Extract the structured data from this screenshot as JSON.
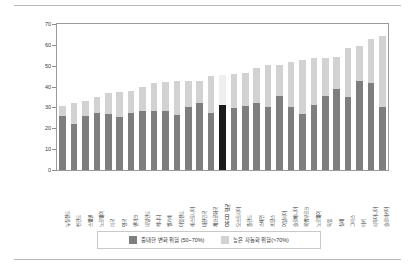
{
  "chart": {
    "type": "bar",
    "title": "",
    "axis": {
      "ylabel": "",
      "xlabel": "",
      "ylim": [
        0,
        70
      ],
      "yticks": [
        0,
        10,
        20,
        30,
        40,
        50,
        60,
        70
      ],
      "grid": false
    },
    "legend": {
      "position": "bottom",
      "entries": [
        {
          "label": "중대한 변화 위험 (50~70%)",
          "color": "#7e7e7e",
          "key": "significant_change"
        },
        {
          "label": "높은 자동화 위험(>70%)",
          "color": "#d2d2d2",
          "key": "high_automation"
        }
      ]
    },
    "highlight": {
      "category": "OECD 평균",
      "color": "#1a1a1a"
    }
  },
  "chart_data": {
    "type": "bar",
    "stacked": true,
    "title": "",
    "xlabel": "",
    "ylabel": "",
    "ylim": [
      0,
      70
    ],
    "yticks": [
      0,
      10,
      20,
      30,
      40,
      50,
      60,
      70
    ],
    "grid": false,
    "legend_position": "bottom",
    "categories": [
      "뉴질랜드",
      "핀란드",
      "스웨덴",
      "노르웨이",
      "미국",
      "영국",
      "덴마크",
      "네덜란드",
      "캐나다",
      "벨기에",
      "아일랜드",
      "에스토니아",
      "대한민국",
      "체코공화국",
      "OECD 평균",
      "오스트리아",
      "폴란드",
      "스페인",
      "프랑스",
      "이탈리아",
      "슬로베니아",
      "룩셈부르크",
      "노르웨이",
      "독일",
      "칠레",
      "그리스",
      "터키",
      "리투아니아",
      "슬로바키아"
    ],
    "series": [
      {
        "name": "중대한 변화 위험 (50~70%)",
        "color": "#7e7e7e",
        "values": [
          25.7,
          22.3,
          26.1,
          27.1,
          26.8,
          25.6,
          27.2,
          28.3,
          28.3,
          28.3,
          26.6,
          30.3,
          32.2,
          27.5,
          31.4,
          29.5,
          30.6,
          32.3,
          30.2,
          35.7,
          30.2,
          26.7,
          31.1,
          35.6,
          39.0,
          35.0,
          42.9,
          41.9,
          30.3
        ]
      },
      {
        "name": "높은 자동화 위험(>70%)",
        "color": "#d2d2d2",
        "values": [
          5.2,
          9.8,
          6.9,
          7.8,
          10.2,
          11.8,
          10.6,
          11.6,
          13.4,
          13.8,
          15.9,
          12.6,
          10.7,
          17.4,
          14.0,
          16.7,
          16.1,
          16.8,
          20.2,
          14.8,
          21.4,
          25.9,
          22.5,
          18.1,
          15.0,
          23.4,
          16.5,
          20.8,
          33.9
        ]
      }
    ],
    "totals": [
      30.9,
      32.1,
      33.0,
      34.9,
      37.0,
      37.4,
      37.8,
      39.9,
      41.7,
      42.1,
      42.5,
      42.9,
      42.9,
      44.9,
      45.4,
      46.2,
      46.7,
      49.1,
      50.4,
      50.5,
      51.6,
      52.6,
      53.6,
      53.7,
      54.0,
      58.4,
      59.4,
      62.7,
      64.2
    ]
  },
  "colors": {
    "significant_change": "#7e7e7e",
    "high_automation": "#d2d2d2",
    "highlight": "#1a1a1a",
    "axis": "#9a9a9a",
    "text": "#3a3a3a"
  }
}
